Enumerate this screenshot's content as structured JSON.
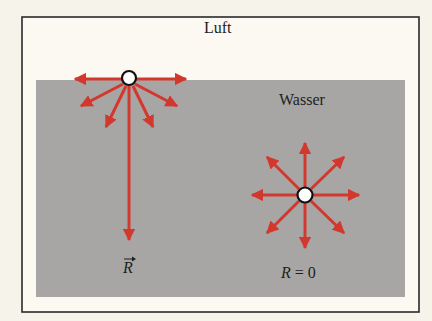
{
  "regions": {
    "air_label": "Luft",
    "water_label": "Wasser"
  },
  "molecules": [
    {
      "id": "surface-molecule",
      "position": "at water surface",
      "force_directions": [
        "left",
        "right",
        "down-left-shallow",
        "down-right-shallow",
        "down-left-steep",
        "down-right-steep",
        "down"
      ],
      "resultant_label": "R",
      "resultant_vector": true,
      "resultant_direction": "down"
    },
    {
      "id": "interior-molecule",
      "position": "inside water",
      "force_directions": [
        "up",
        "up-right",
        "right",
        "down-right",
        "down",
        "down-left",
        "left",
        "up-left"
      ],
      "resultant_label_var": "R",
      "resultant_label_rest": " = 0"
    }
  ],
  "colors": {
    "background": "#f6f3ea",
    "frame": "#2a2a2a",
    "water": "#a7a6a4",
    "arrow": "#d3382e",
    "molecule_outline": "#111111",
    "molecule_fill": "#ffffff"
  }
}
